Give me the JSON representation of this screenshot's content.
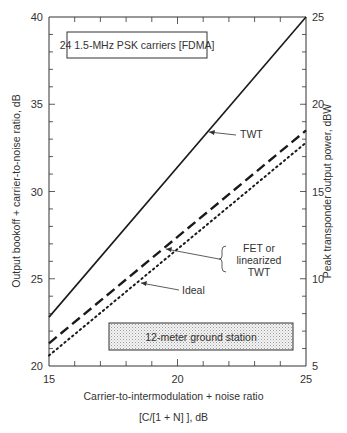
{
  "chart_data": {
    "type": "line",
    "title": "",
    "inset_label": "24 1.5-MHz PSK carriers [FDMA]",
    "footer_box_label": "12-meter ground station",
    "xlabel_line1": "Carrier-to-intermodulation + noise ratio",
    "xlabel_line2": "[C/[1 + N] ], dB",
    "ylabel_left": "Output bookoff + carrier-to-noise ratio, dB",
    "ylabel_right": "Peak transponder output power, dBW",
    "xlim": [
      15,
      25
    ],
    "ylim_left": [
      20,
      40
    ],
    "ylim_right": [
      5,
      25
    ],
    "x_ticks": [
      "15",
      "20",
      "25"
    ],
    "y_left_ticks": [
      "20",
      "25",
      "30",
      "35",
      "40"
    ],
    "y_right_ticks": [
      "5",
      "10",
      "15",
      "20",
      "25"
    ],
    "grid": false,
    "x": [
      15,
      25
    ],
    "series": [
      {
        "name": "TWT",
        "style": "solid",
        "values": [
          22.8,
          40.0
        ]
      },
      {
        "name": "FET or linearized TWT",
        "style": "dashed",
        "values": [
          21.3,
          33.5
        ]
      },
      {
        "name": "Ideal",
        "style": "dotted",
        "values": [
          20.6,
          32.8
        ]
      }
    ],
    "annotations": [
      {
        "text": "TWT",
        "arrow_to_series": "TWT"
      },
      {
        "text": "FET or linearized TWT",
        "lines": [
          "FET or",
          "linearized",
          "TWT"
        ],
        "arrow_to_series": "FET or linearized TWT"
      },
      {
        "text": "Ideal",
        "arrow_to_series": "Ideal"
      }
    ]
  }
}
